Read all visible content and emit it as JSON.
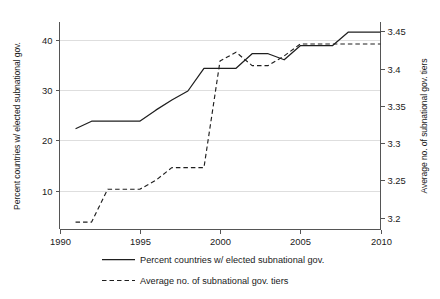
{
  "chart_data": {
    "type": "line",
    "title": "",
    "subtitle": "",
    "xlabel": "",
    "ylabel": "Percent countries w/ elected subnational gov.",
    "y2label": "Average no. of subnational gov. tiers",
    "grid": true,
    "legend_position": "bottom",
    "xlim": [
      1990,
      2010
    ],
    "ylim": [
      2.3,
      43.5
    ],
    "y2lim": [
      3.184,
      3.4625
    ],
    "xticks": [
      1990,
      1995,
      2000,
      2005,
      2010
    ],
    "xtick_labels": [
      "1990",
      "1995",
      "2000",
      "2005",
      "2010"
    ],
    "yticks": [
      10,
      20,
      30,
      40
    ],
    "ytick_labels": [
      "10",
      "20",
      "30",
      "40"
    ],
    "y2ticks": [
      3.2,
      3.25,
      3.3,
      3.35,
      3.4,
      3.45
    ],
    "y2tick_labels": [
      "3.2",
      "3.25",
      "3.3",
      "3.35",
      "3.4",
      "3.45"
    ],
    "x": [
      1991,
      1992,
      1993,
      1994,
      1995,
      1996,
      1997,
      1998,
      1999,
      2000,
      2001,
      2002,
      2003,
      2004,
      2005,
      2006,
      2007,
      2008,
      2009,
      2010
    ],
    "series": [
      {
        "name": "Percent countries w/ elected subnational gov.",
        "axis": "left",
        "style": "solid",
        "values": [
          22.3,
          23.8,
          23.8,
          23.8,
          23.8,
          26.0,
          28.0,
          29.8,
          34.3,
          34.3,
          34.3,
          37.2,
          37.2,
          36.0,
          38.8,
          38.8,
          38.8,
          41.5,
          41.5,
          41.5
        ]
      },
      {
        "name": "Average no. of subnational gov. tiers",
        "axis": "right",
        "style": "dashed",
        "values": [
          3.194,
          3.194,
          3.238,
          3.238,
          3.238,
          3.25,
          3.267,
          3.267,
          3.267,
          3.41,
          3.422,
          3.404,
          3.404,
          3.417,
          3.433,
          3.433,
          3.433,
          3.433,
          3.433,
          3.433
        ]
      }
    ]
  },
  "legend": {
    "items": [
      {
        "label": "Percent countries w/ elected subnational gov.",
        "style": "solid"
      },
      {
        "label": "Average no. of subnational gov. tiers",
        "style": "dashed"
      }
    ]
  },
  "colors": {
    "series": "#1f1f1f",
    "grid": "#d6d6d6",
    "axis": "#555555",
    "text": "#1a1a1a",
    "background": "#ffffff"
  }
}
